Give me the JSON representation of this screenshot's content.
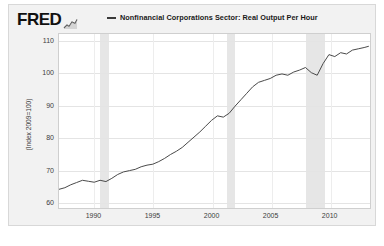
{
  "brand": {
    "name": "FRED",
    "mark_icon": "line-chart-icon"
  },
  "legend": {
    "dash_icon": "line-swatch-icon",
    "label": "Nonfinancial Corporations Sector: Real Output Per Hour"
  },
  "axes": {
    "ylabel": "(Index 2009=100)",
    "yticks": [
      "110",
      "100",
      "90",
      "80",
      "70",
      "60"
    ],
    "xticks": [
      "1990",
      "1995",
      "2000",
      "2005",
      "2010"
    ]
  },
  "colors": {
    "line": "#4a4a4a",
    "figure_background": "#f2f2f2",
    "plot_background": "#ffffff",
    "recession_band": "#e6e6e6",
    "gridline": "#e4e4e4",
    "text": "#3c3c3c"
  },
  "chart_data": {
    "type": "line",
    "title": "Nonfinancial Corporations Sector: Real Output Per Hour",
    "xlabel": "",
    "ylabel": "(Index 2009=100)",
    "xlim": [
      1987.0,
      2013.5
    ],
    "ylim": [
      58,
      112
    ],
    "yticks": [
      60,
      70,
      80,
      90,
      100,
      110
    ],
    "xticks": [
      1990,
      1995,
      2000,
      2005,
      2010
    ],
    "grid": true,
    "legend_position": "top",
    "series": [
      {
        "name": "Nonfinancial Corporations Sector: Real Output Per Hour",
        "x": [
          1987.0,
          1987.5,
          1988.0,
          1988.5,
          1989.0,
          1989.5,
          1990.0,
          1990.5,
          1991.0,
          1991.5,
          1992.0,
          1992.5,
          1993.0,
          1993.5,
          1994.0,
          1994.5,
          1995.0,
          1995.5,
          1996.0,
          1996.5,
          1997.0,
          1997.5,
          1998.0,
          1998.5,
          1999.0,
          1999.5,
          2000.0,
          2000.5,
          2001.0,
          2001.5,
          2002.0,
          2002.5,
          2003.0,
          2003.5,
          2004.0,
          2004.5,
          2005.0,
          2005.5,
          2006.0,
          2006.5,
          2007.0,
          2007.5,
          2008.0,
          2008.5,
          2009.0,
          2009.5,
          2010.0,
          2010.5,
          2011.0,
          2011.5,
          2012.0,
          2012.5,
          2013.0,
          2013.4
        ],
        "values": [
          63.8,
          64.3,
          65.2,
          65.9,
          66.6,
          66.3,
          66.0,
          66.6,
          66.2,
          67.2,
          68.4,
          69.2,
          69.6,
          70.0,
          70.8,
          71.3,
          71.6,
          72.4,
          73.4,
          74.6,
          75.6,
          76.8,
          78.4,
          80.0,
          81.6,
          83.4,
          85.2,
          86.6,
          86.2,
          87.4,
          89.6,
          91.6,
          93.6,
          95.6,
          97.0,
          97.6,
          98.2,
          99.2,
          99.6,
          99.2,
          100.2,
          100.8,
          101.6,
          100.0,
          99.2,
          102.8,
          105.6,
          105.0,
          106.2,
          105.8,
          107.0,
          107.4,
          107.8,
          108.2
        ]
      }
    ],
    "recession_bands": [
      {
        "start": 1990.5,
        "end": 1991.2
      },
      {
        "start": 2001.2,
        "end": 2001.9
      },
      {
        "start": 2007.9,
        "end": 2009.5
      }
    ]
  }
}
